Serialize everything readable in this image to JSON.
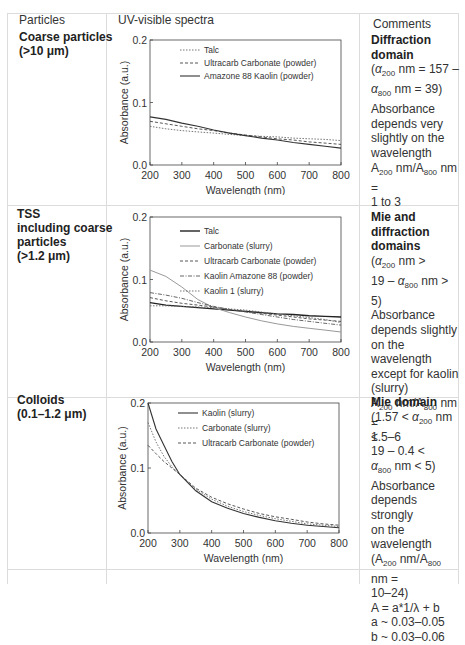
{
  "headers": {
    "particles": "Particles",
    "spectra": "UV-visible spectra",
    "comments": "Comments"
  },
  "rows": [
    {
      "particle_lines": [
        "Coarse particles",
        "(>10 μm)"
      ],
      "comment_title": "Diffraction domain",
      "comment_lines": [
        "(α200 nm = 157 –",
        "α800 nm = 39)",
        "Absorbance",
        "depends very",
        "slightly on the",
        "wavelength",
        "A200 nm/A800 nm =",
        "1 to 3"
      ]
    },
    {
      "particle_lines": [
        "TSS",
        "including coarse",
        "particles",
        "(>1.2 μm)"
      ],
      "comment_title": "Mie and diffraction domains",
      "comment_lines": [
        "(α200 nm >",
        "19 – α800 nm > 5)",
        "Absorbance",
        "depends slightly",
        "on the wavelength",
        "except for kaolin",
        "(slurry)",
        "A200 nm/A800 nm =",
        "1.5–6"
      ]
    },
    {
      "particle_lines": [
        "Colloids",
        "(0.1–1.2 μm)"
      ],
      "comment_title": "Mie domain",
      "comment_lines": [
        "(1.57 < α200 nm <",
        "19 – 0.4 <",
        "α800 nm < 5)",
        "Absorbance",
        "depends strongly",
        "on the wavelength",
        "(A200 nm/A800 nm =",
        "10–24)",
        "A = a*1/λ + b",
        "a ~ 0.03–0.05",
        "b ~ 0.03–0.06"
      ]
    }
  ],
  "chart_data": [
    {
      "type": "line",
      "title": "Coarse particles (>10 μm)",
      "xlabel": "Wavelength (nm)",
      "ylabel": "Absorbance (a.u.)",
      "xlim": [
        200,
        800
      ],
      "ylim": [
        0,
        0.2
      ],
      "xticks": [
        200,
        300,
        400,
        500,
        600,
        700,
        800
      ],
      "yticks": [
        "0.0",
        "0.1",
        "0.2"
      ],
      "grid": false,
      "legend_position": "upper center",
      "x": [
        200,
        250,
        300,
        350,
        400,
        450,
        500,
        550,
        600,
        650,
        700,
        750,
        800
      ],
      "series": [
        {
          "name": "Talc",
          "style": "dotted",
          "values": [
            0.062,
            0.058,
            0.055,
            0.053,
            0.051,
            0.049,
            0.047,
            0.046,
            0.045,
            0.043,
            0.042,
            0.041,
            0.039
          ]
        },
        {
          "name": "Ultracarb Carbonate (powder)",
          "style": "dashed",
          "values": [
            0.07,
            0.066,
            0.062,
            0.058,
            0.055,
            0.051,
            0.048,
            0.045,
            0.042,
            0.04,
            0.037,
            0.035,
            0.033
          ]
        },
        {
          "name": "Amazone 88 Kaolin (powder)",
          "style": "solid",
          "values": [
            0.077,
            0.073,
            0.067,
            0.062,
            0.056,
            0.051,
            0.047,
            0.043,
            0.04,
            0.036,
            0.033,
            0.03,
            0.027
          ]
        }
      ]
    },
    {
      "type": "line",
      "title": "TSS including coarse particles (>1.2 μm)",
      "xlabel": "Wavelength (nm)",
      "ylabel": "Absorbance (a.u.)",
      "xlim": [
        200,
        800
      ],
      "ylim": [
        0,
        0.2
      ],
      "xticks": [
        200,
        300,
        400,
        500,
        600,
        700,
        800
      ],
      "yticks": [
        "0.0",
        "0.1",
        "0.2"
      ],
      "grid": false,
      "legend_position": "upper center",
      "x": [
        200,
        250,
        300,
        350,
        400,
        450,
        500,
        550,
        600,
        650,
        700,
        750,
        800
      ],
      "series": [
        {
          "name": "Talc",
          "style": "solid-bold",
          "values": [
            0.063,
            0.059,
            0.057,
            0.055,
            0.053,
            0.051,
            0.049,
            0.047,
            0.045,
            0.044,
            0.042,
            0.041,
            0.04
          ]
        },
        {
          "name": "Carbonate (slurry)",
          "style": "solid-light",
          "values": [
            0.115,
            0.105,
            0.088,
            0.068,
            0.055,
            0.047,
            0.04,
            0.034,
            0.029,
            0.025,
            0.022,
            0.019,
            0.016
          ]
        },
        {
          "name": "Ultracarb Carbonate  (powder)",
          "style": "dashed",
          "values": [
            0.071,
            0.066,
            0.062,
            0.059,
            0.056,
            0.052,
            0.049,
            0.046,
            0.043,
            0.04,
            0.037,
            0.035,
            0.033
          ]
        },
        {
          "name": "Kaolin Amazone 88 (powder)",
          "style": "dashdot",
          "values": [
            0.079,
            0.075,
            0.07,
            0.063,
            0.057,
            0.052,
            0.048,
            0.044,
            0.04,
            0.036,
            0.033,
            0.03,
            0.027
          ]
        },
        {
          "name": "Kaolin 1 (slurry)",
          "style": "dotted",
          "values": [
            0.058,
            0.058,
            0.057,
            0.056,
            0.055,
            0.053,
            0.051,
            0.048,
            0.045,
            0.042,
            0.039,
            0.036,
            0.031
          ]
        }
      ]
    },
    {
      "type": "line",
      "title": "Colloids (0.1–1.2 μm)",
      "xlabel": "Wavelength (nm)",
      "ylabel": "Absorbance (a.u.)",
      "xlim": [
        200,
        800
      ],
      "ylim": [
        0,
        0.2
      ],
      "xticks": [
        200,
        300,
        400,
        500,
        600,
        700,
        800
      ],
      "yticks": [
        "0.0",
        "0.1",
        "0.2"
      ],
      "grid": false,
      "legend_position": "upper center",
      "x": [
        200,
        225,
        250,
        275,
        300,
        350,
        400,
        450,
        500,
        550,
        600,
        650,
        700,
        750,
        800
      ],
      "series": [
        {
          "name": "Kaolin  (slurry)",
          "style": "solid",
          "values": [
            0.2,
            0.16,
            0.135,
            0.11,
            0.09,
            0.065,
            0.048,
            0.038,
            0.03,
            0.024,
            0.019,
            0.015,
            0.012,
            0.01,
            0.008
          ]
        },
        {
          "name": "Carbonate (slurry)",
          "style": "dotted",
          "values": [
            0.17,
            0.14,
            0.118,
            0.102,
            0.09,
            0.067,
            0.052,
            0.041,
            0.033,
            0.027,
            0.022,
            0.018,
            0.014,
            0.012,
            0.01
          ]
        },
        {
          "name": "Ultracarb Carbonate (powder)",
          "style": "dashed",
          "values": [
            0.135,
            0.122,
            0.11,
            0.1,
            0.09,
            0.069,
            0.055,
            0.045,
            0.037,
            0.03,
            0.025,
            0.021,
            0.017,
            0.014,
            0.012
          ]
        }
      ]
    }
  ]
}
